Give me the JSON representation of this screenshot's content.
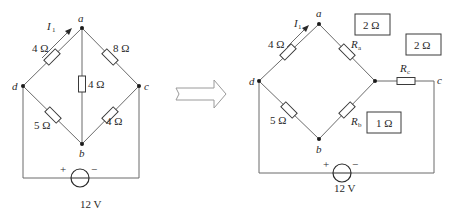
{
  "diagram": {
    "transform_arrow": "right-arrow",
    "left_circuit": {
      "nodes": {
        "a": "a",
        "b": "b",
        "c": "c",
        "d": "d"
      },
      "current_label": "I",
      "current_sub": "1",
      "resistors": {
        "da": "4 Ω",
        "ac": "8 Ω",
        "ab": "4 Ω",
        "db": "5 Ω",
        "bc": "4 Ω"
      },
      "source": {
        "voltage": "12 V",
        "plus": "+",
        "minus": "−"
      }
    },
    "right_circuit": {
      "nodes": {
        "a": "a",
        "b": "b",
        "c": "c",
        "d": "d"
      },
      "current_label": "I",
      "current_sub": "1",
      "resistors": {
        "da": "4 Ω",
        "db": "5 Ω",
        "Ra": {
          "label": "R",
          "sub": "a"
        },
        "Rb": {
          "label": "R",
          "sub": "b"
        },
        "Rc": {
          "label": "R",
          "sub": "c"
        }
      },
      "value_boxes": {
        "Ra_value": "2 Ω",
        "Rc_value": "2 Ω",
        "Rb_value": "1 Ω"
      },
      "source": {
        "voltage": "12 V",
        "plus": "+",
        "minus": "−"
      }
    }
  }
}
